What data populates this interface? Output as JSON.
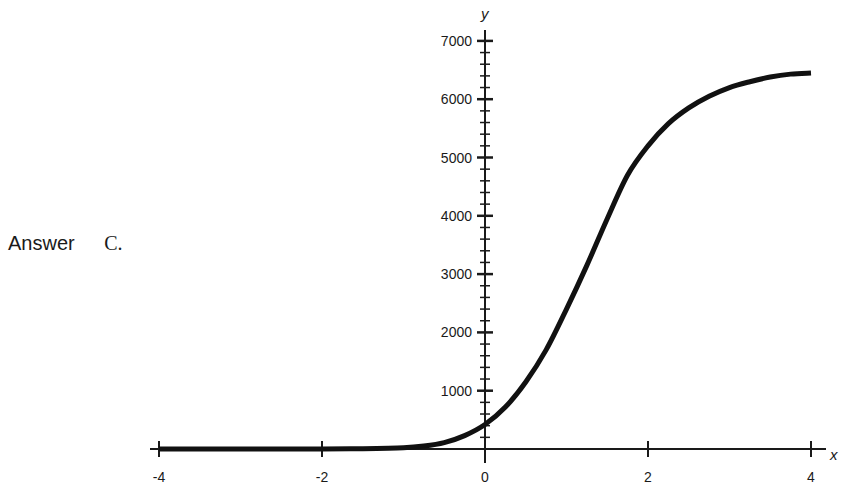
{
  "answer": {
    "label": "Answer",
    "value": "C."
  },
  "chart_data": {
    "type": "line",
    "title": "",
    "xlabel": "x",
    "ylabel": "y",
    "xlim": [
      -4,
      4
    ],
    "ylim": [
      0,
      7000
    ],
    "grid": false,
    "legend": null,
    "x_ticks": [
      -4,
      -2,
      0,
      2,
      4
    ],
    "x_tick_labels": [
      "-4",
      "-2",
      "0",
      "2",
      "4"
    ],
    "y_ticks": [
      1000,
      2000,
      3000,
      4000,
      5000,
      6000,
      7000
    ],
    "y_tick_labels": [
      "1000",
      "2000",
      "3000",
      "4000",
      "5000",
      "6000",
      "7000"
    ],
    "y_minor_tick_step": 200,
    "series": [
      {
        "name": "logistic curve",
        "color": "#111111",
        "x": [
          -4,
          -3,
          -2,
          -1.5,
          -1,
          -0.75,
          -0.5,
          -0.25,
          0,
          0.25,
          0.5,
          0.75,
          1,
          1.25,
          1.5,
          1.75,
          2,
          2.25,
          2.5,
          2.75,
          3,
          3.25,
          3.5,
          3.75,
          4
        ],
        "y": [
          0,
          0,
          0,
          5,
          20,
          50,
          110,
          230,
          420,
          720,
          1150,
          1700,
          2400,
          3150,
          3950,
          4700,
          5200,
          5580,
          5850,
          6050,
          6200,
          6300,
          6380,
          6430,
          6450
        ]
      }
    ]
  }
}
